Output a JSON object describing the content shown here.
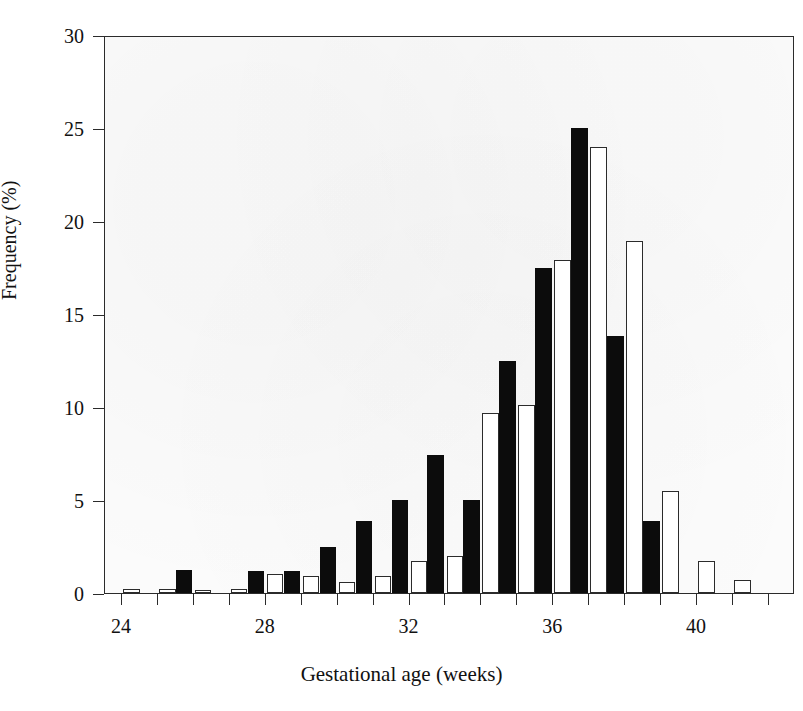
{
  "chart_data": {
    "type": "bar",
    "title": "",
    "xlabel": "Gestational age (weeks)",
    "ylabel": "Frequency (%)",
    "xlim": [
      23.0,
      42.5
    ],
    "ylim": [
      0,
      30
    ],
    "ytick_values": [
      0,
      5,
      10,
      15,
      20,
      25,
      30
    ],
    "ytick_labels": [
      "0",
      "5",
      "10",
      "15",
      "20",
      "25",
      "30"
    ],
    "xtick_values": [
      24,
      25,
      26,
      27,
      28,
      29,
      30,
      31,
      32,
      33,
      34,
      35,
      36,
      37,
      38,
      39,
      40,
      41,
      42
    ],
    "xtick_labeled": [
      24,
      28,
      32,
      36,
      40
    ],
    "xtick_labels": [
      "24",
      "",
      "",
      "",
      "28",
      "",
      "",
      "",
      "32",
      "",
      "",
      "",
      "36",
      "",
      "",
      "",
      "40",
      "",
      ""
    ],
    "grid": false,
    "legend_position": "none",
    "categories": [
      24,
      25,
      26,
      27,
      28,
      29,
      30,
      31,
      32,
      33,
      34,
      35,
      36,
      37,
      38,
      39,
      40,
      41
    ],
    "series": [
      {
        "name": "filled",
        "fill": "#0c0c0c",
        "values": [
          0,
          0,
          1.25,
          0,
          1.2,
          1.2,
          2.5,
          3.85,
          5.0,
          7.4,
          5.0,
          12.5,
          17.5,
          25.0,
          13.8,
          3.85,
          0,
          0
        ]
      },
      {
        "name": "open",
        "fill": "#ffffff",
        "values": [
          0.2,
          0.2,
          0.15,
          0.2,
          1.0,
          0.9,
          0.6,
          0.9,
          1.7,
          2.0,
          9.7,
          10.1,
          17.9,
          24.0,
          18.9,
          5.5,
          1.7,
          0.7
        ]
      }
    ]
  },
  "colors": {
    "axis": "#2b2b2b",
    "filled_bar": "#0c0c0c",
    "open_bar_fill": "#ffffff",
    "open_bar_stroke": "#2b2b2b",
    "plot_background": "#fbfbfb",
    "page_background": "#ffffff"
  }
}
